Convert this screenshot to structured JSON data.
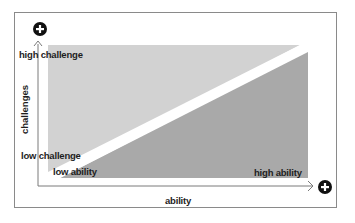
{
  "diagram": {
    "type": "flow-channel",
    "y_axis": {
      "title": "challenges",
      "top_label": "high challenge",
      "bottom_label": "low challenge",
      "end_icon": "plus-circle-icon"
    },
    "x_axis": {
      "title": "ability",
      "left_label": "low ability",
      "right_label": "high ability",
      "end_icon": "plus-circle-icon"
    },
    "regions": [
      {
        "name": "upper-left-region",
        "color": "#d2d2d2"
      },
      {
        "name": "diagonal-band",
        "color": "#ffffff"
      },
      {
        "name": "lower-right-region",
        "color": "#a9a9a9"
      }
    ],
    "colors": {
      "frame": "#8a8a8a",
      "axis": "#7a7a7a",
      "icon": "#111111",
      "text": "#1e1e1e"
    }
  }
}
